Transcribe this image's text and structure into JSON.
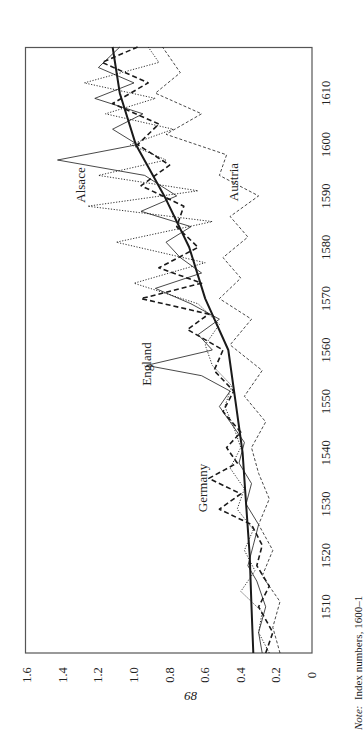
{
  "chart_data": {
    "type": "line",
    "orientation": "rotated 90° counter-clockwise (years run bottom-to-top along right side, values run right-to-left)",
    "title": "",
    "xlabel": "",
    "ylabel": "",
    "xlim": [
      1501,
      1619
    ],
    "ylim": [
      0,
      1.6
    ],
    "x_ticks": [
      1510,
      1520,
      1530,
      1540,
      1550,
      1560,
      1570,
      1580,
      1590,
      1600,
      1610
    ],
    "y_ticks": [
      "0",
      "0.2",
      "0.4",
      "0.6",
      "0.8",
      "1.0",
      "1.2",
      "1.4",
      "1.6"
    ],
    "grid": false,
    "legend": "inline labels",
    "series": [
      {
        "name": "Trend",
        "style": "thick-solid",
        "x": [
          1501,
          1510,
          1520,
          1530,
          1540,
          1550,
          1560,
          1570,
          1580,
          1590,
          1600,
          1610,
          1619
        ],
        "values": [
          0.33,
          0.34,
          0.35,
          0.37,
          0.39,
          0.43,
          0.47,
          0.6,
          0.69,
          0.83,
          0.99,
          1.08,
          1.12
        ]
      },
      {
        "name": "England",
        "style": "thin-solid",
        "x": [
          1501,
          1505,
          1510,
          1515,
          1518,
          1522,
          1526,
          1530,
          1534,
          1538,
          1542,
          1546,
          1549,
          1552,
          1555,
          1557,
          1560,
          1563,
          1566,
          1569,
          1572,
          1575,
          1578,
          1581,
          1584,
          1587,
          1590,
          1594,
          1597,
          1600,
          1603,
          1606,
          1609,
          1612,
          1615,
          1619
        ],
        "values": [
          0.28,
          0.3,
          0.26,
          0.31,
          0.36,
          0.33,
          0.3,
          0.37,
          0.34,
          0.41,
          0.38,
          0.46,
          0.52,
          0.46,
          0.62,
          0.93,
          0.56,
          0.64,
          0.52,
          0.68,
          0.88,
          0.62,
          0.74,
          0.82,
          0.68,
          0.96,
          0.76,
          0.94,
          1.43,
          0.98,
          1.12,
          0.95,
          1.22,
          1.0,
          1.2,
          1.08
        ]
      },
      {
        "name": "Germany",
        "style": "thick-dashed",
        "x": [
          1501,
          1505,
          1510,
          1514,
          1518,
          1522,
          1526,
          1529,
          1532,
          1535,
          1538,
          1541,
          1544,
          1548,
          1552,
          1556,
          1560,
          1564,
          1567,
          1570,
          1573,
          1576,
          1580,
          1584,
          1588,
          1592,
          1596,
          1600,
          1604,
          1608,
          1612,
          1616,
          1619
        ],
        "values": [
          0.26,
          0.22,
          0.3,
          0.24,
          0.31,
          0.28,
          0.34,
          0.52,
          0.4,
          0.58,
          0.42,
          0.48,
          0.4,
          0.5,
          0.44,
          0.55,
          0.5,
          0.7,
          0.58,
          0.96,
          0.62,
          0.86,
          0.64,
          0.76,
          0.72,
          0.96,
          0.8,
          0.98,
          0.86,
          1.12,
          0.92,
          1.18,
          0.98
        ]
      },
      {
        "name": "Alsace",
        "style": "dotted",
        "x": [
          1501,
          1505,
          1509,
          1513,
          1517,
          1521,
          1525,
          1529,
          1533,
          1537,
          1541,
          1545,
          1549,
          1553,
          1557,
          1561,
          1565,
          1569,
          1573,
          1577,
          1581,
          1585,
          1588,
          1591,
          1594,
          1597,
          1600,
          1603,
          1606,
          1609,
          1612,
          1616,
          1619
        ],
        "values": [
          0.24,
          0.3,
          0.28,
          0.4,
          0.32,
          0.38,
          0.33,
          0.42,
          0.38,
          0.46,
          0.4,
          0.44,
          0.49,
          0.45,
          0.56,
          0.6,
          0.52,
          0.64,
          1.0,
          0.6,
          1.1,
          0.56,
          1.26,
          0.64,
          1.2,
          0.82,
          1.02,
          0.78,
          1.16,
          0.88,
          1.28,
          0.86,
          0.92
        ]
      },
      {
        "name": "Austria",
        "style": "thin-dashed",
        "x": [
          1501,
          1506,
          1511,
          1516,
          1521,
          1526,
          1531,
          1536,
          1541,
          1546,
          1551,
          1556,
          1561,
          1566,
          1570,
          1574,
          1578,
          1582,
          1586,
          1590,
          1594,
          1598,
          1602,
          1606,
          1610,
          1614,
          1619
        ],
        "values": [
          0.18,
          0.22,
          0.18,
          0.28,
          0.22,
          0.3,
          0.24,
          0.3,
          0.34,
          0.26,
          0.38,
          0.28,
          0.46,
          0.34,
          0.52,
          0.4,
          0.5,
          0.36,
          0.46,
          0.3,
          0.52,
          0.48,
          0.82,
          0.62,
          0.88,
          0.74,
          0.84
        ]
      }
    ],
    "annotations": [
      {
        "text": "Alsace",
        "near_year": 1587,
        "near_value": 1.3
      },
      {
        "text": "Austria",
        "near_year": 1588,
        "near_value": 0.44
      },
      {
        "text": "England",
        "near_year": 1558,
        "near_value": 0.93
      },
      {
        "text": "Germany",
        "near_year": 1530,
        "near_value": 0.61
      }
    ]
  },
  "labels": {
    "alsace": "Alsace",
    "austria": "Austria",
    "england": "England",
    "germany": "Germany"
  },
  "page_number": "68",
  "note": {
    "prefix": "Note:",
    "text": "Index numbers, 1600–1"
  },
  "colors": {
    "ink": "#1a1a1a",
    "frame": "#555555",
    "background": "#ffffff"
  }
}
